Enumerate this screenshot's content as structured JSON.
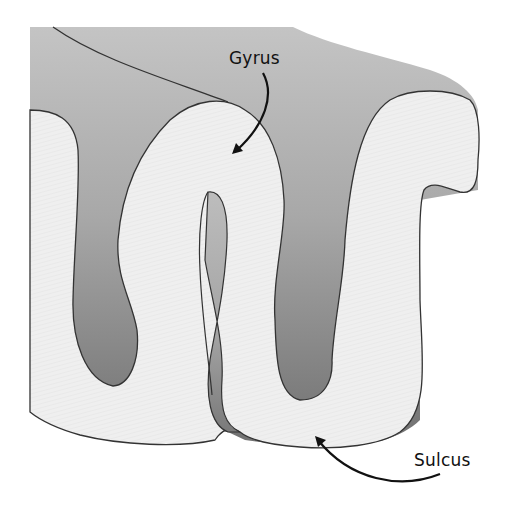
{
  "diagram": {
    "labels": {
      "gyrus": "Gyrus",
      "sulcus": "Sulcus"
    },
    "parts": [
      {
        "id": "gyrus",
        "label": "Gyrus",
        "description": "Ridge of folded cortex (light surface)",
        "arrow_tip": [
          235,
          152
        ]
      },
      {
        "id": "sulcus",
        "label": "Sulcus",
        "description": "Groove between gyri",
        "arrow_tip": [
          316,
          438
        ]
      }
    ],
    "colors": {
      "surface": "#ececec",
      "gray_light": "#c2c2c2",
      "gray_dark": "#7a7a7a",
      "outline": "#333333",
      "label": "#111111"
    }
  }
}
